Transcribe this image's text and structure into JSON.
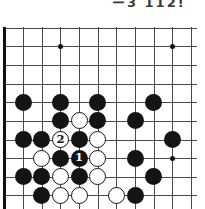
{
  "page": {
    "caption_fragment": "ー3 112!"
  },
  "board": {
    "grid": {
      "cols": 11,
      "rows": 10,
      "cell": 18.65,
      "origin_x": 4.5,
      "origin_y": 27.6,
      "h_line_start_x": 3,
      "h_line_end_x": 197,
      "v_line_end_y": 209,
      "line_color": "#4a4a4a",
      "edge_color": "#111111"
    },
    "star_points": [
      {
        "col": 4,
        "row": 2
      },
      {
        "col": 10,
        "row": 2
      },
      {
        "col": 10,
        "row": 8
      }
    ],
    "stones": [
      {
        "col": 2,
        "row": 5,
        "color": "black",
        "label": ""
      },
      {
        "col": 4,
        "row": 5,
        "color": "black",
        "label": ""
      },
      {
        "col": 6,
        "row": 5,
        "color": "black",
        "label": ""
      },
      {
        "col": 9,
        "row": 5,
        "color": "black",
        "label": ""
      },
      {
        "col": 4,
        "row": 6,
        "color": "black",
        "label": ""
      },
      {
        "col": 5,
        "row": 6,
        "color": "white",
        "label": ""
      },
      {
        "col": 6,
        "row": 6,
        "color": "black",
        "label": ""
      },
      {
        "col": 8,
        "row": 6,
        "color": "black",
        "label": ""
      },
      {
        "col": 2,
        "row": 7,
        "color": "black",
        "label": ""
      },
      {
        "col": 3,
        "row": 7,
        "color": "black",
        "label": ""
      },
      {
        "col": 4,
        "row": 7,
        "color": "white",
        "label": "2"
      },
      {
        "col": 5,
        "row": 7,
        "color": "black",
        "label": ""
      },
      {
        "col": 6,
        "row": 7,
        "color": "white",
        "label": ""
      },
      {
        "col": 10,
        "row": 7,
        "color": "black",
        "label": ""
      },
      {
        "col": 3,
        "row": 8,
        "color": "white",
        "label": ""
      },
      {
        "col": 4,
        "row": 8,
        "color": "black",
        "label": ""
      },
      {
        "col": 5,
        "row": 8,
        "color": "black",
        "label": "1"
      },
      {
        "col": 6,
        "row": 8,
        "color": "white",
        "label": ""
      },
      {
        "col": 8,
        "row": 8,
        "color": "black",
        "label": ""
      },
      {
        "col": 2,
        "row": 9,
        "color": "black",
        "label": ""
      },
      {
        "col": 3,
        "row": 9,
        "color": "black",
        "label": ""
      },
      {
        "col": 4,
        "row": 9,
        "color": "white",
        "label": ""
      },
      {
        "col": 5,
        "row": 9,
        "color": "black",
        "label": ""
      },
      {
        "col": 6,
        "row": 9,
        "color": "white",
        "label": ""
      },
      {
        "col": 9,
        "row": 9,
        "color": "black",
        "label": ""
      },
      {
        "col": 3,
        "row": 10,
        "color": "black",
        "label": ""
      },
      {
        "col": 4,
        "row": 10,
        "color": "white",
        "label": ""
      },
      {
        "col": 5,
        "row": 10,
        "color": "white",
        "label": ""
      },
      {
        "col": 7,
        "row": 10,
        "color": "white",
        "label": ""
      },
      {
        "col": 8,
        "row": 10,
        "color": "black",
        "label": ""
      }
    ]
  }
}
